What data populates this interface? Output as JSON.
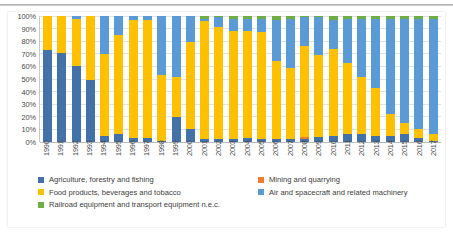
{
  "chart_data": {
    "type": "bar",
    "subtype": "stacked-100-percent",
    "title": "",
    "xlabel": "",
    "ylabel": "",
    "ylim": [
      0,
      100
    ],
    "ytick_labels": [
      "0%",
      "10%",
      "20%",
      "30%",
      "40%",
      "50%",
      "60%",
      "70%",
      "80%",
      "90%",
      "100%"
    ],
    "ytick_values": [
      0,
      10,
      20,
      30,
      40,
      50,
      60,
      70,
      80,
      90,
      100
    ],
    "grid": true,
    "legend_position": "bottom",
    "categories": [
      "1990",
      "1991",
      "1992",
      "1993",
      "1994",
      "1995",
      "1996",
      "1997",
      "1998",
      "1999",
      "2000",
      "2001",
      "2002",
      "2003",
      "2004",
      "2005",
      "2006",
      "2007",
      "2008",
      "2009",
      "2010",
      "2011",
      "2012",
      "2013",
      "2014",
      "2015",
      "2016",
      "2017"
    ],
    "series": [
      {
        "name": "Agriculture, forestry and fishing",
        "color": "#4472a8",
        "values": [
          73,
          71,
          60,
          49,
          5,
          6,
          3,
          3,
          1,
          20,
          10,
          2,
          2,
          2,
          3,
          2,
          2,
          2,
          2,
          4,
          5,
          6,
          6,
          5,
          5,
          6,
          3,
          1
        ]
      },
      {
        "name": "Mining and quarrying",
        "color": "#ed7d31",
        "values": [
          0,
          0,
          0,
          0,
          0,
          0,
          0,
          0,
          0,
          0,
          0,
          0,
          0,
          0,
          0,
          0,
          0,
          0,
          2,
          0,
          0,
          0,
          0,
          0,
          0,
          0,
          0,
          0
        ]
      },
      {
        "name": "Food products, beverages and tobacco",
        "color": "#ffc000",
        "values": [
          27,
          29,
          38,
          51,
          65,
          79,
          94,
          94,
          52,
          32,
          69,
          94,
          89,
          86,
          85,
          85,
          62,
          57,
          72,
          65,
          69,
          57,
          46,
          38,
          17,
          9,
          7,
          5
        ]
      },
      {
        "name": "Air and spacecraft and related machinery",
        "color": "#5b9bd5",
        "values": [
          0,
          0,
          2,
          0,
          30,
          15,
          3,
          3,
          47,
          48,
          21,
          2,
          8,
          10,
          10,
          11,
          33,
          39,
          23,
          30,
          23,
          35,
          46,
          55,
          76,
          83,
          88,
          92
        ]
      },
      {
        "name": "Railroad equipment and transport equipment n.e.c.",
        "color": "#70ad47",
        "values": [
          0,
          0,
          0,
          0,
          0,
          0,
          0,
          0,
          0,
          0,
          0,
          2,
          1,
          2,
          2,
          2,
          3,
          2,
          1,
          1,
          3,
          2,
          2,
          2,
          2,
          2,
          2,
          2
        ]
      }
    ]
  },
  "legend": {
    "items": [
      {
        "label": "Agriculture, forestry and fishing",
        "color": "#4472a8"
      },
      {
        "label": "Mining and quarrying",
        "color": "#ed7d31"
      },
      {
        "label": "Food products, beverages and tobacco",
        "color": "#ffc000"
      },
      {
        "label": "Air and spacecraft and related machinery",
        "color": "#5b9bd5"
      },
      {
        "label": "Railroad equipment and transport equipment n.e.c.",
        "color": "#70ad47"
      }
    ]
  }
}
